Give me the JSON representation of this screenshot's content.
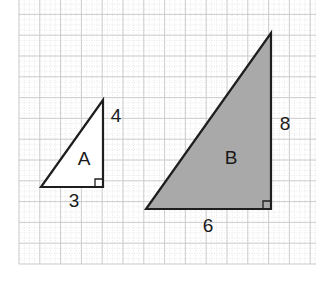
{
  "diagram": {
    "type": "similar-right-triangles-on-grid",
    "grid": {
      "x0": 19,
      "y0": 0,
      "x1": 316,
      "y1": 264,
      "major_spacing": 20.8,
      "minor_divisions": 4,
      "major_color": "#c8c8c8",
      "minor_color": "#e2e2e2"
    },
    "triangles": [
      {
        "id": "A",
        "label": "A",
        "fill": "#ffffff",
        "stroke": "#1e1e1e",
        "vertices": {
          "bottom_left": [
            41,
            187
          ],
          "right_angle": [
            103,
            187
          ],
          "top": [
            103,
            100
          ]
        },
        "base_label": "3",
        "height_label": "4",
        "label_pos": [
          84,
          165
        ],
        "base_label_pos": [
          74,
          207
        ],
        "height_label_pos": [
          116,
          122
        ]
      },
      {
        "id": "B",
        "label": "B",
        "fill": "#a9a9a9",
        "stroke": "#1e1e1e",
        "vertices": {
          "bottom_left": [
            146,
            209
          ],
          "right_angle": [
            271,
            209
          ],
          "top": [
            271,
            33
          ]
        },
        "base_label": "6",
        "height_label": "8",
        "label_pos": [
          231,
          164
        ],
        "base_label_pos": [
          208,
          232
        ],
        "height_label_pos": [
          285,
          130
        ]
      }
    ]
  }
}
